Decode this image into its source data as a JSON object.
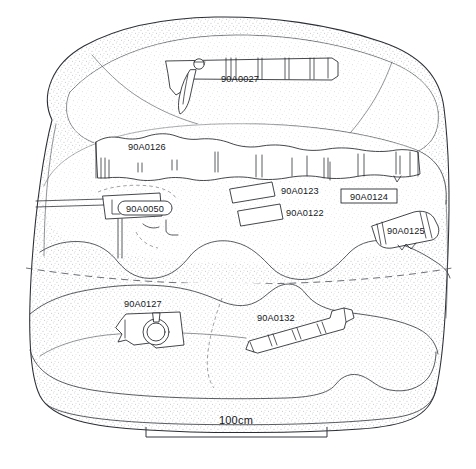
{
  "figure": {
    "type": "archaeological-site-plan",
    "scale_bar": {
      "label": "100cm",
      "length_px": 181
    },
    "caption": ""
  },
  "artifacts": [
    {
      "id": "90A0027",
      "label": "90A0027",
      "kind": "cannon",
      "label_style": "plain",
      "label_x": 240,
      "label_y": 82
    },
    {
      "id": "90A0126",
      "label": "90A0126",
      "kind": "timber",
      "label_style": "plain",
      "label_x": 128,
      "label_y": 150
    },
    {
      "id": "90A0050",
      "label": "90A0050",
      "kind": "concretion",
      "label_style": "rounded-box",
      "label_x": 121,
      "label_y": 210
    },
    {
      "id": "90A0123",
      "label": "90A0123",
      "kind": "concretion-bar",
      "label_style": "plain",
      "label_x": 281,
      "label_y": 194
    },
    {
      "id": "90A0122",
      "label": "90A0122",
      "kind": "concretion-bar",
      "label_style": "plain",
      "label_x": 286,
      "label_y": 216
    },
    {
      "id": "90A0124",
      "label": "90A0124",
      "kind": "concretion",
      "label_style": "box",
      "label_x": 369,
      "label_y": 196
    },
    {
      "id": "90A0125",
      "label": "90A0125",
      "kind": "concretion",
      "label_style": "plain",
      "label_x": 387,
      "label_y": 231
    },
    {
      "id": "90A0127",
      "label": "90A0127",
      "kind": "ring-fitting",
      "label_style": "plain",
      "label_x": 124,
      "label_y": 307
    },
    {
      "id": "90A0132",
      "label": "90A0132",
      "kind": "cannon",
      "label_style": "plain",
      "label_x": 257,
      "label_y": 321
    }
  ],
  "colors": {
    "ink": "#23262b",
    "stipple": "#9aa0a8",
    "paper": "#ffffff",
    "dashed": "#5d6066"
  }
}
